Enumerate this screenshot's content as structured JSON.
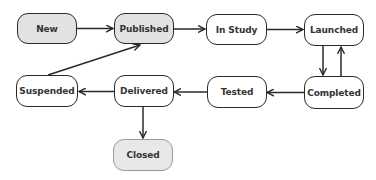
{
  "diagram": {
    "type": "state-transition",
    "colors": {
      "line": "#2a2a2a",
      "filled_node": "#e2e2e2",
      "terminal_node": "#e8e8e8",
      "terminal_border": "#9a9a9a",
      "text": "#333333"
    },
    "nodes": [
      {
        "id": "new",
        "label": "New",
        "style": "filled"
      },
      {
        "id": "published",
        "label": "Published",
        "style": "filled"
      },
      {
        "id": "in_study",
        "label": "In Study",
        "style": "plain"
      },
      {
        "id": "launched",
        "label": "Launched",
        "style": "plain"
      },
      {
        "id": "completed",
        "label": "Completed",
        "style": "plain"
      },
      {
        "id": "tested",
        "label": "Tested",
        "style": "plain"
      },
      {
        "id": "delivered",
        "label": "Delivered",
        "style": "plain"
      },
      {
        "id": "suspended",
        "label": "Suspended",
        "style": "plain"
      },
      {
        "id": "closed",
        "label": "Closed",
        "style": "terminal"
      }
    ],
    "edges": [
      {
        "from": "New",
        "to": "Published"
      },
      {
        "from": "Published",
        "to": "In Study"
      },
      {
        "from": "In Study",
        "to": "Launched"
      },
      {
        "from": "Launched",
        "to": "Completed"
      },
      {
        "from": "Completed",
        "to": "Launched"
      },
      {
        "from": "Completed",
        "to": "Tested"
      },
      {
        "from": "Tested",
        "to": "Delivered"
      },
      {
        "from": "Delivered",
        "to": "Suspended"
      },
      {
        "from": "Delivered",
        "to": "Closed"
      },
      {
        "from": "Suspended",
        "to": "Published"
      }
    ]
  }
}
